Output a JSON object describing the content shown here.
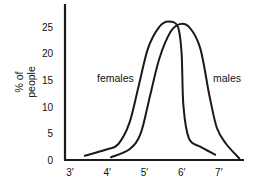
{
  "chart_data": {
    "type": "line",
    "title": "",
    "xlabel": "",
    "ylabel": "% of people",
    "ylabel_lines": [
      "% of",
      "people"
    ],
    "x_ticks": [
      "3′",
      "4′",
      "5′",
      "6′",
      "7′"
    ],
    "y_ticks": [
      "0",
      "5",
      "10",
      "15",
      "20",
      "25"
    ],
    "xlim": [
      3,
      7.6
    ],
    "ylim": [
      0,
      28
    ],
    "grid": false,
    "legend": "inline labels",
    "series": [
      {
        "name": "females",
        "x": [
          3.4,
          4.0,
          4.3,
          4.6,
          4.85,
          5.1,
          5.4,
          5.65,
          5.9,
          6.0,
          6.05,
          6.2,
          6.5,
          6.9
        ],
        "y": [
          0.8,
          2.0,
          3.0,
          7.0,
          14.0,
          21.0,
          25.0,
          26.0,
          25.0,
          20.0,
          10.0,
          4.0,
          2.5,
          1.0
        ]
      },
      {
        "name": "males",
        "x": [
          4.1,
          4.6,
          4.9,
          5.15,
          5.4,
          5.7,
          5.95,
          6.2,
          6.5,
          6.75,
          6.95,
          7.2,
          7.55
        ],
        "y": [
          0.5,
          2.0,
          5.0,
          12.0,
          19.0,
          24.0,
          25.5,
          25.0,
          21.0,
          12.0,
          6.0,
          3.0,
          0.3
        ]
      }
    ],
    "annotations": [
      {
        "text": "females",
        "near_series": "females"
      },
      {
        "text": "males",
        "near_series": "males"
      }
    ]
  },
  "labels": {
    "ylabel_line1": "% of",
    "ylabel_line2": "people",
    "females": "females",
    "males": "males"
  },
  "colors": {
    "line": "#1a1a1a",
    "axis": "#1a1a1a",
    "background": "#ffffff"
  }
}
